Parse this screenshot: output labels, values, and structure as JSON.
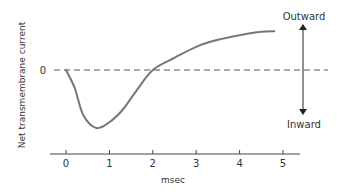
{
  "chart_data": {
    "type": "line",
    "title": "",
    "xlabel": "msec",
    "ylabel": "Net transmembrane current",
    "x_ticks": [
      "0",
      "1",
      "2",
      "3",
      "4",
      "5"
    ],
    "y_ticks": [
      "0"
    ],
    "xlim": [
      0,
      5.5
    ],
    "ylim": [
      -1.1,
      1.0
    ],
    "grid": false,
    "legend": null,
    "annotations": {
      "up": "Outward",
      "down": "Inward",
      "zero_line": "dashed"
    },
    "series": [
      {
        "name": "Net current",
        "x": [
          0,
          0.2,
          0.4,
          0.7,
          1.0,
          1.3,
          1.6,
          2.0,
          2.5,
          3.0,
          3.5,
          4.0,
          4.5,
          4.8
        ],
        "values": [
          0,
          -0.31,
          -0.78,
          -1.0,
          -0.9,
          -0.69,
          -0.38,
          0,
          0.21,
          0.4,
          0.52,
          0.6,
          0.66,
          0.67
        ]
      }
    ]
  },
  "labels": {
    "ylabel": "Net transmembrane current",
    "xlabel": "msec",
    "zero": "0",
    "outward": "Outward",
    "inward": "Inward",
    "ticks": [
      "0",
      "1",
      "2",
      "3",
      "4",
      "5"
    ]
  }
}
